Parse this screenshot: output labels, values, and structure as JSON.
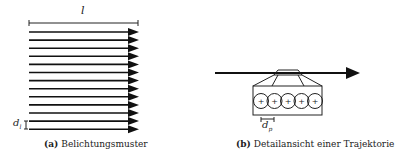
{
  "panel_a": {
    "tag": "(a)",
    "caption": "Belichtungsmuster",
    "length_label": "l",
    "spacing_label": "d",
    "spacing_sub": "l",
    "line_count": 13
  },
  "panel_b": {
    "tag": "(b)",
    "caption": "Detailansicht einer Trajektorie",
    "diameter_label": "d",
    "diameter_sub": "p",
    "spot_count": 5,
    "spot_symbol": "+"
  }
}
